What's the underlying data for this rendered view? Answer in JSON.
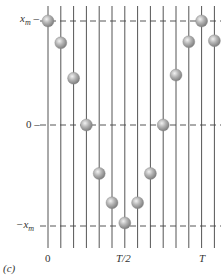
{
  "figure": {
    "panel_label": "(c)",
    "y_labels": {
      "top": "x",
      "top_sub": "m",
      "middle": "0",
      "bottom": "−x",
      "bottom_sub": "m"
    },
    "x_labels": {
      "start": "0",
      "half": "T/2",
      "end": "T"
    },
    "line_color": "#555555",
    "dash_color": "#444444",
    "ball_color": "#9a9a9a"
  },
  "chart_data": {
    "type": "scatter",
    "title": "",
    "xlabel": "t",
    "ylabel": "x",
    "x_ticks": [
      "0",
      "T/2",
      "T"
    ],
    "y_ticks": [
      "x_m",
      "0",
      "-x_m"
    ],
    "frames": 14,
    "x": [
      0,
      0.083,
      0.167,
      0.25,
      0.333,
      0.417,
      0.5,
      0.583,
      0.667,
      0.75,
      0.833,
      0.917,
      1.0,
      1.083
    ],
    "y": [
      1.0,
      0.79,
      0.45,
      0.0,
      -0.48,
      -0.77,
      -0.97,
      -0.77,
      -0.48,
      0.0,
      0.48,
      0.8,
      1.0,
      0.81
    ],
    "ylim": [
      -1,
      1
    ],
    "grid": "vertical lines per frame, dashed horizontal at x_m, 0, -x_m"
  }
}
